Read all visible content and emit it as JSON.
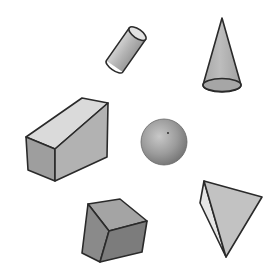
{
  "scene": {
    "description": "Six grey 3D geometric solids drawn on a white background",
    "background": "#ffffff",
    "shapes": [
      {
        "name": "cylinder",
        "position": "top-center",
        "color": "#b9b9b9"
      },
      {
        "name": "cone",
        "position": "top-right",
        "color": "#b0b0b0"
      },
      {
        "name": "rectangular-prism",
        "position": "middle-left",
        "color": "#c4c4c4"
      },
      {
        "name": "sphere",
        "position": "center",
        "color": "#9a9a9a"
      },
      {
        "name": "cube",
        "position": "bottom-center",
        "color": "#8e8e8e"
      },
      {
        "name": "tetrahedron",
        "position": "bottom-right",
        "color": "#c0c0c0"
      }
    ]
  }
}
